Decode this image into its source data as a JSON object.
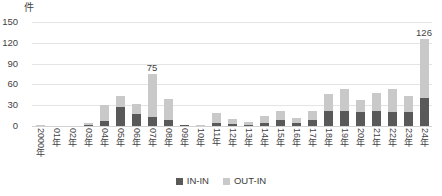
{
  "chart_data": {
    "type": "bar",
    "title": "",
    "subtitle": "",
    "xlabel": "",
    "ylabel": "件",
    "unit_label": "件",
    "stacked": true,
    "grid": true,
    "legend_position": "bottom-center",
    "ylim": [
      0,
      150
    ],
    "yticks": [
      150,
      120,
      90,
      60,
      30,
      0
    ],
    "categories": [
      "2000年",
      "01年",
      "02年",
      "03年",
      "04年",
      "05年",
      "06年",
      "07年",
      "08年",
      "09年",
      "10年",
      "11年",
      "12年",
      "13年",
      "14年",
      "15年",
      "16年",
      "17年",
      "18年",
      "19年",
      "20年",
      "21年",
      "22年",
      "23年",
      "24年"
    ],
    "series": [
      {
        "name": "IN-IN",
        "color": "#595959",
        "values": [
          0,
          0,
          0,
          1,
          7,
          28,
          18,
          13,
          8,
          1,
          0,
          5,
          3,
          2,
          4,
          8,
          4,
          9,
          22,
          22,
          20,
          22,
          20,
          20,
          40
        ]
      },
      {
        "name": "OUT-IN",
        "color": "#c9c9c9",
        "values": [
          1,
          0,
          0,
          4,
          24,
          16,
          14,
          62,
          31,
          1,
          1,
          14,
          7,
          4,
          11,
          14,
          8,
          12,
          24,
          31,
          17,
          25,
          33,
          23,
          86
        ]
      }
    ],
    "totals": [
      1,
      0,
      0,
      5,
      31,
      44,
      32,
      75,
      39,
      2,
      1,
      19,
      10,
      6,
      15,
      22,
      12,
      21,
      46,
      53,
      37,
      47,
      53,
      43,
      126
    ],
    "data_labels": [
      {
        "category": "07年",
        "value": "75"
      },
      {
        "category": "24年",
        "value": "126"
      }
    ],
    "colors": {
      "in_in": "#595959",
      "out_in": "#c9c9c9",
      "gridline": "#e4e4e4",
      "axis": "#d2d2d2",
      "text": "#3f3f3f",
      "background": "#ffffff"
    }
  },
  "legend": {
    "entries": [
      {
        "label": "IN-IN",
        "swatch": "legend-swatch-in-in"
      },
      {
        "label": "OUT-IN",
        "swatch": "legend-swatch-out-in"
      }
    ]
  }
}
